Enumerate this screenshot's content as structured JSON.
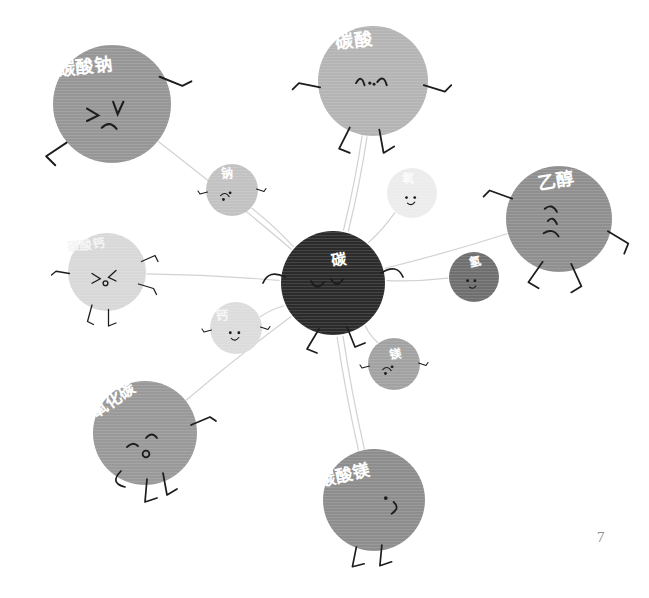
{
  "page": {
    "width": 649,
    "height": 598,
    "background": "#ffffff",
    "page_number": "7",
    "page_number_pos": {
      "x": 597,
      "y": 529
    },
    "edge_color": "#d2d2d2"
  },
  "center": {
    "id": "carbon",
    "label": "碳",
    "cx": 333,
    "cy": 283,
    "r": 52,
    "color": "#2b2b2b",
    "label_color": "#ffffff",
    "font_size": 15,
    "label_dx": 6,
    "label_dy": -24,
    "label_rotate": -8,
    "mood": "neutral"
  },
  "nodes": [
    {
      "id": "sodium-carbonate",
      "label": "碳酸钠",
      "cx": 112,
      "cy": 104,
      "r": 59,
      "color": "#969696",
      "label_color": "#ffffff",
      "font_size": 18,
      "label_dx": -27,
      "label_dy": -37,
      "label_rotate": -6,
      "mood": "wink"
    },
    {
      "id": "carbonic-acid",
      "label": "碳酸",
      "cx": 373,
      "cy": 81,
      "r": 55,
      "color": "#b4b4b4",
      "label_color": "#ffffff",
      "font_size": 18,
      "label_dx": -19,
      "label_dy": -40,
      "label_rotate": -7,
      "mood": "worried"
    },
    {
      "id": "ethanol",
      "label": "乙醇",
      "cx": 559,
      "cy": 219,
      "r": 53,
      "color": "#8f8f8f",
      "label_color": "#ffffff",
      "font_size": 18,
      "label_dx": -3,
      "label_dy": -38,
      "label_rotate": -10,
      "mood": "frown"
    },
    {
      "id": "calcium-carbonate",
      "label": "碳酸钙",
      "cx": 107,
      "cy": 272,
      "r": 39,
      "color": "#d8d8d8",
      "label_color": "#f4f4f4",
      "font_size": 12,
      "label_dx": -21,
      "label_dy": -27,
      "label_rotate": -5,
      "mood": "surprised"
    },
    {
      "id": "carbon-dioxide",
      "label": "二氧化碳",
      "cx": 145,
      "cy": 433,
      "r": 52,
      "color": "#999999",
      "label_color": "#ffffff",
      "font_size": 16,
      "label_dx": -38,
      "label_dy": -28,
      "label_rotate": -34,
      "mood": "unamused"
    },
    {
      "id": "magnesium-carbonate",
      "label": "碳酸镁",
      "cx": 374,
      "cy": 500,
      "r": 51,
      "color": "#8d8d8d",
      "label_color": "#ffffff",
      "font_size": 17,
      "label_dx": -30,
      "label_dy": -24,
      "label_rotate": -13,
      "mood": "smile-side"
    },
    {
      "id": "sodium",
      "label": "钠",
      "cx": 232,
      "cy": 190,
      "r": 26,
      "color": "#c2c2c2",
      "label_color": "#ffffff",
      "font_size": 12,
      "label_dx": -5,
      "label_dy": -16,
      "label_rotate": 0,
      "mood": "squiggle"
    },
    {
      "id": "oxygen",
      "label": "氧",
      "cx": 412,
      "cy": 193,
      "r": 25,
      "color": "#ececec",
      "label_color": "#fbfbfb",
      "font_size": 12,
      "label_dx": -4,
      "label_dy": -14,
      "label_rotate": 0,
      "mood": "smile"
    },
    {
      "id": "hydrogen",
      "label": "氢",
      "cx": 474,
      "cy": 277,
      "r": 25,
      "color": "#6f6f6f",
      "label_color": "#ffffff",
      "font_size": 12,
      "label_dx": 1,
      "label_dy": -15,
      "label_rotate": -12,
      "mood": "neutral-dots"
    },
    {
      "id": "calcium",
      "label": "钙",
      "cx": 236,
      "cy": 328,
      "r": 26,
      "color": "#dcdcdc",
      "label_color": "#f6f6f6",
      "font_size": 12,
      "label_dx": -14,
      "label_dy": -12,
      "label_rotate": 0,
      "mood": "smile"
    },
    {
      "id": "magnesium",
      "label": "镁",
      "cx": 394,
      "cy": 364,
      "r": 26,
      "color": "#a2a2a2",
      "label_color": "#ffffff",
      "font_size": 12,
      "label_dx": 2,
      "label_dy": -10,
      "label_rotate": -8,
      "mood": "squiggle"
    }
  ],
  "edges": [
    {
      "from": "carbon",
      "to": "sodium-carbonate"
    },
    {
      "from": "carbon",
      "to": "carbonic-acid"
    },
    {
      "from": "carbon",
      "to": "carbonic-acid",
      "offset": 5
    },
    {
      "from": "carbon",
      "to": "ethanol"
    },
    {
      "from": "carbon",
      "to": "calcium-carbonate"
    },
    {
      "from": "carbon",
      "to": "carbon-dioxide"
    },
    {
      "from": "carbon",
      "to": "magnesium-carbonate"
    },
    {
      "from": "carbon",
      "to": "magnesium-carbonate",
      "offset": 6
    },
    {
      "from": "carbon",
      "to": "sodium"
    },
    {
      "from": "carbon",
      "to": "oxygen"
    },
    {
      "from": "carbon",
      "to": "hydrogen"
    },
    {
      "from": "carbon",
      "to": "calcium"
    },
    {
      "from": "carbon",
      "to": "magnesium"
    }
  ]
}
